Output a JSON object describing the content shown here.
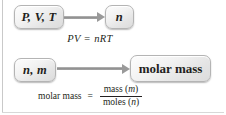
{
  "figure": {
    "background_color": "#ffffff",
    "text_color": "#231f20",
    "arrow_color": "#9a9a9a",
    "node_border_color": "#b4b4b4"
  },
  "rows": [
    {
      "id": "gas-law",
      "source_label": "P, V, T",
      "target_label": "n",
      "arrow_icon": "right-arrow-icon",
      "equation": "PV = nRT"
    },
    {
      "id": "molar-mass",
      "source_label": "n, m",
      "target_label": "molar mass",
      "arrow_icon": "right-arrow-icon",
      "equation": {
        "lhs": "molar mass",
        "operator": "=",
        "numerator_text": "mass (",
        "numerator_var": "m",
        "numerator_close": ")",
        "denominator_text": "moles (",
        "denominator_var": "n",
        "denominator_close": ")"
      }
    }
  ]
}
